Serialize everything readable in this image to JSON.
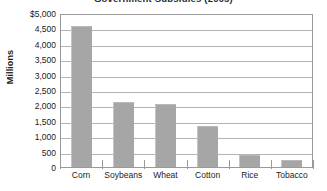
{
  "chart_data": {
    "type": "bar",
    "title": "Government Subsidies (2005)",
    "xlabel": "",
    "ylabel": "Millions",
    "categories": [
      "Corn",
      "Soybeans",
      "Wheat",
      "Cotton",
      "Rice",
      "Tobacco"
    ],
    "values": [
      4580,
      2100,
      2030,
      1330,
      400,
      230
    ],
    "ylim": [
      0,
      5000
    ],
    "ytick_step": 500,
    "ytick_labels": [
      "$5,000",
      "4,500",
      "4,000",
      "3,500",
      "3,000",
      "2,500",
      "2,000",
      "1,500",
      "1,000",
      "500",
      "0"
    ],
    "ytick_values": [
      5000,
      4500,
      4000,
      3500,
      3000,
      2500,
      2000,
      1500,
      1000,
      500,
      0
    ],
    "grid": true,
    "legend": null,
    "bar_color": "#a6a6a6",
    "gridline_color": "#b4b4b4",
    "frame_color": "#9a9a9a",
    "background_color": "#ffffff"
  }
}
